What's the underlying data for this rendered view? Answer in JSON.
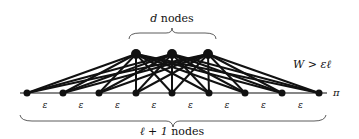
{
  "diagram": {
    "top_label": "d nodes",
    "top_label_var": "d",
    "top_label_text": " nodes",
    "bottom_label_var": "ℓ + 1",
    "bottom_label_text": " nodes",
    "weight_label": "W > εℓ",
    "path_label": "π",
    "edge_label": "ε",
    "top_nodes": [
      136,
      172,
      208
    ],
    "top_y": 54,
    "bottom_nodes": [
      27,
      63,
      99,
      136,
      172,
      209,
      245,
      282,
      319
    ],
    "bottom_y": 93,
    "edge_labels_count": 8,
    "colors": {
      "node": "#111111",
      "edge": "#111111",
      "background": "#ffffff"
    }
  }
}
